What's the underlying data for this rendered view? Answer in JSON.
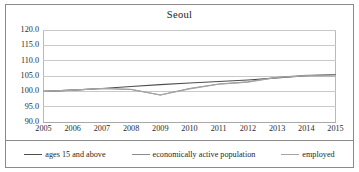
{
  "chart_data": {
    "type": "line",
    "title": "Seoul",
    "xlabel": "",
    "ylabel": "",
    "x": [
      2005,
      2006,
      2007,
      2008,
      2009,
      2010,
      2011,
      2012,
      2013,
      2014,
      2015
    ],
    "categories": [
      "2005",
      "2006",
      "2007",
      "2008",
      "2009",
      "2010",
      "2011",
      "2012",
      "2013",
      "2014",
      "2015"
    ],
    "ylim": [
      90.0,
      120.0
    ],
    "ytick_labels": [
      "120.0",
      "115.0",
      "110.0",
      "105.0",
      "100.0",
      "95.0",
      "90.0"
    ],
    "ytick_values": [
      120.0,
      115.0,
      110.0,
      105.0,
      100.0,
      95.0,
      90.0
    ],
    "grid": true,
    "legend_position": "bottom",
    "series": [
      {
        "name": "ages 15 and above",
        "color": "#4d4d4d",
        "values": [
          100.0,
          100.4,
          100.9,
          101.6,
          102.2,
          102.7,
          103.2,
          103.7,
          104.4,
          105.1,
          105.5
        ]
      },
      {
        "name": "economically active population",
        "color": "#8c8c8c",
        "values": [
          100.0,
          100.4,
          100.9,
          100.6,
          98.8,
          100.9,
          102.4,
          103.1,
          104.6,
          105.2,
          105.4
        ]
      },
      {
        "name": "employed",
        "color": "#a6a6a6",
        "values": [
          100.0,
          100.4,
          100.9,
          100.7,
          98.8,
          100.8,
          102.3,
          103.0,
          104.5,
          105.1,
          105.0
        ]
      }
    ]
  }
}
